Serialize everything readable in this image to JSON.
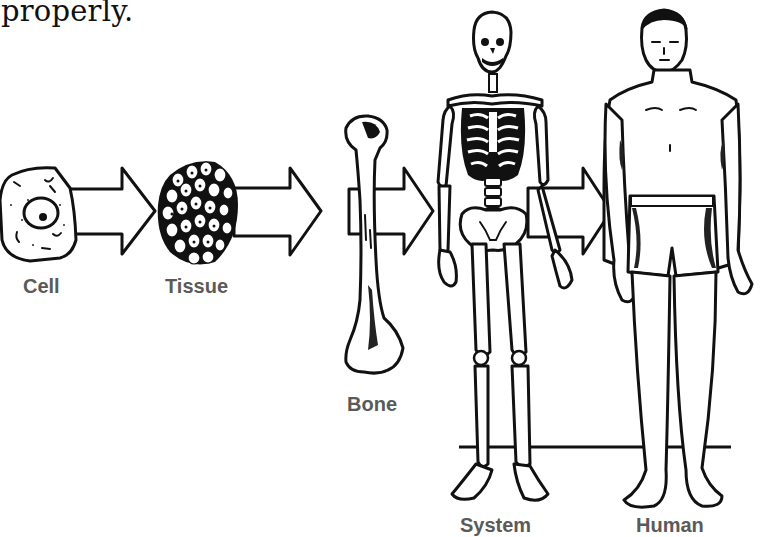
{
  "intro_text": "properly.",
  "diagram": {
    "stages": [
      {
        "id": "cell",
        "label": "Cell"
      },
      {
        "id": "tissue",
        "label": "Tissue"
      },
      {
        "id": "bone",
        "label": "Bone"
      },
      {
        "id": "system",
        "label": "System"
      },
      {
        "id": "human",
        "label": "Human"
      }
    ],
    "arrows": [
      "cell-to-tissue",
      "tissue-to-bone",
      "bone-to-system",
      "system-to-human"
    ],
    "colors": {
      "ink": "#111111",
      "label": "#5a5a5a",
      "background": "#ffffff"
    }
  }
}
